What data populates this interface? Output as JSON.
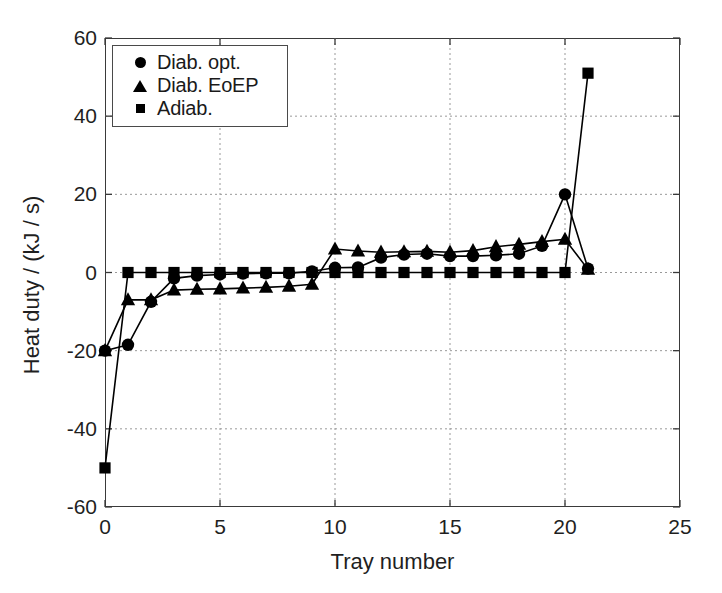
{
  "chart_data": {
    "type": "line",
    "title": "",
    "xlabel": "Tray number",
    "ylabel": "Heat duty / (kJ / s)",
    "xlim": [
      0,
      25
    ],
    "ylim": [
      -60,
      60
    ],
    "xticks": [
      0,
      5,
      10,
      15,
      20,
      25
    ],
    "yticks": [
      -60,
      -40,
      -20,
      0,
      20,
      40,
      60
    ],
    "xtick_labels": [
      "0",
      "5",
      "10",
      "15",
      "20",
      "25"
    ],
    "ytick_labels": [
      "-60",
      "-40",
      "-20",
      "0",
      "20",
      "40",
      "60"
    ],
    "grid": true,
    "grid_style": "dashed",
    "grid_color": "#999999",
    "legend_position": "upper left",
    "marker_color": "#000000",
    "line_color": "#000000",
    "background": "#ffffff",
    "x": [
      0,
      1,
      2,
      3,
      4,
      5,
      6,
      7,
      8,
      9,
      10,
      11,
      12,
      13,
      14,
      15,
      16,
      17,
      18,
      19,
      20,
      21
    ],
    "series": [
      {
        "name": "Diab. opt.",
        "marker": "circle",
        "values": [
          -20,
          -18.5,
          -7.5,
          -1.5,
          -0.8,
          -0.5,
          -0.3,
          -0.2,
          -0.2,
          0.3,
          1.2,
          1.3,
          3.8,
          4.6,
          4.8,
          4.2,
          4.2,
          4.4,
          4.8,
          6.8,
          20,
          1
        ]
      },
      {
        "name": "Diab. EoEP",
        "marker": "triangle",
        "values": [
          -20,
          -7,
          -7,
          -4.5,
          -4.3,
          -4.2,
          -4,
          -3.8,
          -3.5,
          -3,
          6,
          5.5,
          5.2,
          5.3,
          5.4,
          5.2,
          5.6,
          6.6,
          7.2,
          7.9,
          8.5,
          0.8
        ]
      },
      {
        "name": "Adiab.",
        "marker": "square",
        "values": [
          -50,
          0,
          0,
          0,
          0,
          0,
          0,
          0,
          0,
          0,
          0,
          0,
          0,
          0,
          0,
          0,
          0,
          0,
          0,
          0,
          0,
          51
        ]
      }
    ]
  },
  "legend": {
    "items": [
      {
        "label": "Diab. opt.",
        "marker": "circle"
      },
      {
        "label": "Diab. EoEP",
        "marker": "triangle"
      },
      {
        "label": "Adiab.",
        "marker": "square"
      }
    ]
  }
}
